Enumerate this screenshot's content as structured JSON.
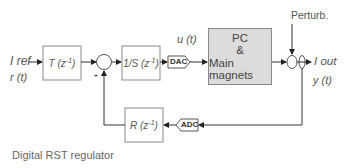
{
  "diagram": {
    "title": "Digital RST regulator",
    "input": {
      "label_main": "I ref",
      "label_sub": "r (t)"
    },
    "blocks": [
      {
        "id": "T",
        "label": "T (z",
        "exp": "-1",
        "close": ")"
      },
      {
        "id": "S",
        "label": "1/S (z",
        "exp": "-1",
        "close": ")"
      },
      {
        "id": "R",
        "label": "R (z",
        "exp": "-1",
        "close": ")"
      },
      {
        "id": "plant",
        "line1": "PC",
        "line2": "&",
        "line3": "Main magnets"
      }
    ],
    "converters": {
      "dac": "DAC",
      "adc": "ADC"
    },
    "signals": {
      "control": "u (t)",
      "perturbation": "Perturb.",
      "output_main": "I out",
      "output_sub": "y (t)",
      "minus_sign": "-"
    },
    "colors": {
      "line": "#333333",
      "box_border": "#8a8a8a",
      "plant_fill": "#dcdcdc",
      "text": "#555555"
    }
  }
}
